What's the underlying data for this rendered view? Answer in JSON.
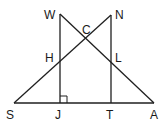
{
  "diagram": {
    "type": "geometry",
    "points": {
      "W": {
        "label": "W",
        "x": 60,
        "y": 14,
        "lx": 44,
        "ly": 19
      },
      "N": {
        "label": "N",
        "x": 111,
        "y": 15,
        "lx": 115,
        "ly": 19
      },
      "C": {
        "label": "C",
        "x": 86,
        "y": 38,
        "lx": 82,
        "ly": 34
      },
      "H": {
        "label": "H",
        "x": 60,
        "y": 61,
        "lx": 45,
        "ly": 62
      },
      "L": {
        "label": "L",
        "x": 111,
        "y": 61,
        "lx": 115,
        "ly": 62
      },
      "S": {
        "label": "S",
        "x": 14,
        "y": 103,
        "lx": 6,
        "ly": 119
      },
      "J": {
        "label": "J",
        "x": 60,
        "y": 103,
        "lx": 55,
        "ly": 119
      },
      "T": {
        "label": "T",
        "x": 111,
        "y": 103,
        "lx": 106,
        "ly": 119
      },
      "A": {
        "label": "A",
        "x": 154,
        "y": 103,
        "lx": 150,
        "ly": 119
      }
    },
    "segments": [
      [
        "W",
        "J"
      ],
      [
        "N",
        "T"
      ],
      [
        "S",
        "A"
      ],
      [
        "S",
        "N"
      ],
      [
        "W",
        "A"
      ]
    ],
    "right_angle_at": "J"
  }
}
